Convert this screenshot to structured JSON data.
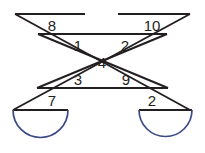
{
  "diagram": {
    "type": "geometry-figure",
    "colors": {
      "line": "#231f20",
      "arc": "#3b4a86",
      "background": "#ffffff"
    },
    "canvas": {
      "width": 205,
      "height": 153
    },
    "angle_labels": [
      {
        "id": "a8",
        "text": "8",
        "x": 52,
        "y": 25
      },
      {
        "id": "a10",
        "text": "10",
        "x": 152,
        "y": 25
      },
      {
        "id": "a1",
        "text": "1",
        "x": 78,
        "y": 45
      },
      {
        "id": "a2t",
        "text": "2",
        "x": 125,
        "y": 45
      },
      {
        "id": "a4",
        "text": "4",
        "x": 102,
        "y": 62
      },
      {
        "id": "a3",
        "text": "3",
        "x": 78,
        "y": 79
      },
      {
        "id": "a9",
        "text": "9",
        "x": 126,
        "y": 79
      },
      {
        "id": "a7",
        "text": "7",
        "x": 52,
        "y": 100
      },
      {
        "id": "a2b",
        "text": "2",
        "x": 152,
        "y": 100
      }
    ],
    "strips": {
      "left_to_right_strip": {
        "description": "band running from upper-left down to lower-right",
        "top_edge": "M15,14 L190,110",
        "bottom_edge": "M38,34 L168,88"
      },
      "right_to_left_strip": {
        "description": "band running from upper-right down to lower-left",
        "top_edge": "M190,14 L13,110",
        "bottom_edge": "M167,34 L37,88"
      }
    },
    "segments": [
      {
        "id": "top-left-horizontal",
        "path": "M15,14 L85,14"
      },
      {
        "id": "top-right-horizontal",
        "path": "M118,14 L190,14"
      },
      {
        "id": "upper-left-band-bottom",
        "path": "M38,34 L105,34"
      },
      {
        "id": "upper-right-band-bottom",
        "path": "M100,34 L167,34"
      },
      {
        "id": "lower-left-band-top",
        "path": "M37,88 L105,88"
      },
      {
        "id": "lower-right-band-top",
        "path": "M100,88 L168,88"
      },
      {
        "id": "bottom-left-horizontal",
        "path": "M13,110 L68,110"
      },
      {
        "id": "bottom-right-horizontal",
        "path": "M139,110 L192,110"
      },
      {
        "id": "diag-a-upper",
        "path": "M15,14 L190,110"
      },
      {
        "id": "diag-b-upper",
        "path": "M190,14 L13,110"
      },
      {
        "id": "diag-a-inner",
        "path": "M38,34 L168,88"
      },
      {
        "id": "diag-b-inner",
        "path": "M167,34 L37,88"
      }
    ],
    "arcs": [
      {
        "id": "left-semicircle",
        "center_x": 40.5,
        "center_y": 110,
        "radius": 27.5,
        "path": "M13,110 A27.5,27.5 0 0 0 68,110"
      },
      {
        "id": "right-semicircle",
        "center_x": 165.5,
        "center_y": 110,
        "radius": 26.5,
        "path": "M139,110 A26.5,26.5 0 0 0 192,110"
      }
    ]
  }
}
